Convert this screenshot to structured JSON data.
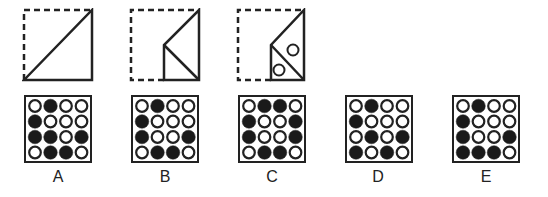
{
  "puzzle": {
    "folding_steps": [
      {
        "id": "step-1",
        "description": "square folded along diagonal"
      },
      {
        "id": "step-2",
        "description": "triangle folded again"
      },
      {
        "id": "step-3",
        "description": "two holes punched"
      }
    ],
    "options": [
      {
        "label": "A",
        "grid": [
          [
            0,
            1,
            0,
            0
          ],
          [
            1,
            0,
            0,
            0
          ],
          [
            1,
            1,
            0,
            1
          ],
          [
            0,
            1,
            1,
            0
          ]
        ]
      },
      {
        "label": "B",
        "grid": [
          [
            0,
            1,
            0,
            0
          ],
          [
            1,
            0,
            0,
            0
          ],
          [
            1,
            0,
            0,
            1
          ],
          [
            0,
            1,
            1,
            0
          ]
        ]
      },
      {
        "label": "C",
        "grid": [
          [
            0,
            1,
            1,
            0
          ],
          [
            1,
            0,
            0,
            1
          ],
          [
            1,
            0,
            0,
            1
          ],
          [
            0,
            1,
            1,
            0
          ]
        ]
      },
      {
        "label": "D",
        "grid": [
          [
            0,
            1,
            0,
            0
          ],
          [
            1,
            0,
            0,
            0
          ],
          [
            0,
            1,
            0,
            1
          ],
          [
            1,
            0,
            1,
            0
          ]
        ]
      },
      {
        "label": "E",
        "grid": [
          [
            0,
            1,
            0,
            0
          ],
          [
            1,
            0,
            0,
            0
          ],
          [
            1,
            0,
            0,
            1
          ],
          [
            1,
            1,
            1,
            0
          ]
        ]
      }
    ],
    "colors": {
      "stroke": "#222222",
      "fill": "#1a1a1a",
      "background": "#ffffff"
    }
  }
}
